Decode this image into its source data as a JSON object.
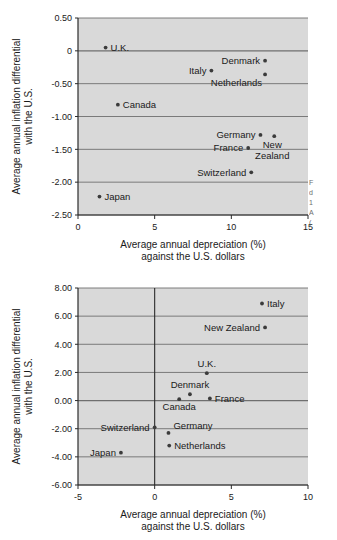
{
  "figures": [
    {
      "id": "figure-1",
      "chart_data": {
        "type": "scatter",
        "title": "",
        "xlabel_line1": "Average annual depreciation (%)",
        "xlabel_line2": "against the U.S. dollars",
        "ylabel_line1": "Average annual inflation differential",
        "ylabel_line2": "with the U.S.",
        "xlim": [
          0,
          15
        ],
        "ylim": [
          -2.5,
          0.5
        ],
        "xticks": [
          0,
          5,
          10,
          15
        ],
        "xticklabels": [
          "0",
          "5",
          "10",
          "15"
        ],
        "yticks": [
          0.5,
          0,
          -0.5,
          -1.0,
          -1.5,
          -2.0,
          -2.5
        ],
        "yticklabels": [
          "0.50",
          "0",
          "-0.50",
          "-1.00",
          "-1.50",
          "-2.00",
          "-2.50"
        ],
        "grid": "horizontal",
        "legend": "none",
        "points": [
          {
            "label": "U.K.",
            "x": 1.8,
            "y": 0.05,
            "label_side": "right"
          },
          {
            "label": "Canada",
            "x": 2.6,
            "y": -0.82,
            "label_side": "right"
          },
          {
            "label": "Italy",
            "x": 8.7,
            "y": -0.3,
            "label_side": "left"
          },
          {
            "label": "Denmark",
            "x": 12.2,
            "y": -0.15,
            "label_side": "left"
          },
          {
            "label": "Netherlands",
            "x": 12.2,
            "y": -0.36,
            "label_side": "below-left"
          },
          {
            "label": "Germany",
            "x": 11.9,
            "y": -1.28,
            "label_side": "left"
          },
          {
            "label": "New Zealand",
            "x": 12.8,
            "y": -1.3,
            "label_side": "below-right"
          },
          {
            "label": "France",
            "x": 11.1,
            "y": -1.48,
            "label_side": "left"
          },
          {
            "label": "Switzerland",
            "x": 11.3,
            "y": -1.85,
            "label_side": "left"
          },
          {
            "label": "Japan",
            "x": 1.4,
            "y": -2.22,
            "label_side": "right"
          }
        ]
      }
    },
    {
      "id": "figure-2",
      "chart_data": {
        "type": "scatter",
        "title": "",
        "xlabel_line1": "Average annual depreciation (%)",
        "xlabel_line2": "against the U.S. dollars",
        "ylabel_line1": "Average annual inflation differential",
        "ylabel_line2": "with the U.S.",
        "xlim": [
          -5,
          10
        ],
        "ylim": [
          -6,
          8
        ],
        "xticks": [
          -5,
          0,
          5,
          10
        ],
        "xticklabels": [
          "-5",
          "0",
          "5",
          "10"
        ],
        "yticks": [
          8,
          6,
          4,
          2,
          0,
          -2,
          -4,
          -6
        ],
        "yticklabels": [
          "8.00",
          "6.00",
          "4.00",
          "2.00",
          "0.00",
          "-2.00",
          "-4.00",
          "-6.00"
        ],
        "grid": "horizontal",
        "legend": "none",
        "points": [
          {
            "label": "Italy",
            "x": 7.0,
            "y": 6.9,
            "label_side": "right"
          },
          {
            "label": "New Zealand",
            "x": 7.2,
            "y": 5.2,
            "label_side": "left"
          },
          {
            "label": "U.K.",
            "x": 3.4,
            "y": 1.95,
            "label_side": "above"
          },
          {
            "label": "Denmark",
            "x": 2.3,
            "y": 0.45,
            "label_side": "above"
          },
          {
            "label": "France",
            "x": 3.6,
            "y": 0.15,
            "label_side": "right"
          },
          {
            "label": "Canada",
            "x": 1.6,
            "y": 0.1,
            "label_side": "below"
          },
          {
            "label": "Switzerland",
            "x": 0.0,
            "y": -1.9,
            "label_side": "left"
          },
          {
            "label": "Germany",
            "x": 0.9,
            "y": -2.3,
            "label_side": "above-right"
          },
          {
            "label": "Netherlands",
            "x": 0.95,
            "y": -3.2,
            "label_side": "right"
          },
          {
            "label": "Japan",
            "x": -2.2,
            "y": -3.7,
            "label_side": "left"
          }
        ]
      }
    }
  ],
  "margin_note": {
    "line1": "F",
    "line2": "d",
    "line3": "1",
    "line4": "A",
    "line5": "("
  },
  "colors": {
    "plot_background": "#d9d9d9",
    "gridline": "#6f6f6f",
    "axis": "#2b2b2b",
    "point": "#3b3b3b",
    "text": "#1a1a1a"
  }
}
